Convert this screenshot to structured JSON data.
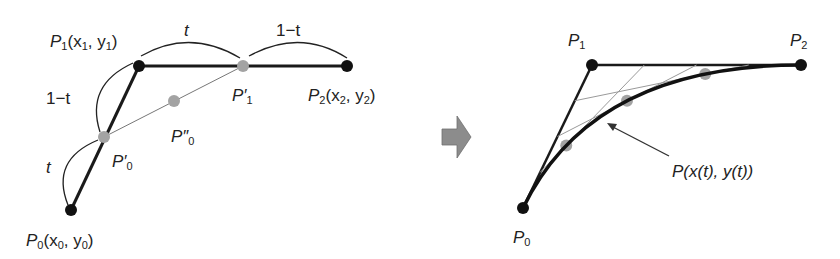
{
  "left_diagram": {
    "title": "de Casteljau construction",
    "points": {
      "P0": {
        "name": "P",
        "sub": "0",
        "coords": "(x",
        "coords_sub": "0",
        "coords_mid": ", y",
        "coords_sub2": "0",
        "coords_end": ")"
      },
      "P1": {
        "name": "P",
        "sub": "1",
        "coords": "(x",
        "coords_sub": "1",
        "coords_mid": ", y",
        "coords_sub2": "1",
        "coords_end": ")"
      },
      "P2": {
        "name": "P",
        "sub": "2",
        "coords": "(x",
        "coords_sub": "2",
        "coords_mid": ", y",
        "coords_sub2": "2",
        "coords_end": ")"
      },
      "P0prime": {
        "name": "P′",
        "sub": "0"
      },
      "P1prime": {
        "name": "P′",
        "sub": "1"
      },
      "P0dprime": {
        "name": "P″",
        "sub": "0"
      }
    },
    "ratio_labels": {
      "top_left": "t",
      "top_right": "1−t",
      "left_upper": "1−t",
      "left_lower": "t"
    },
    "colors": {
      "control_point": "#111111",
      "intermediate_point": "#a0a0a0",
      "line": "#1a1a1a",
      "thin_line": "#888888"
    }
  },
  "transition_arrow": {
    "icon": "right-arrow-icon",
    "color": "#8c8c8c"
  },
  "right_diagram": {
    "points": {
      "P0": {
        "name": "P",
        "sub": "0"
      },
      "P1": {
        "name": "P",
        "sub": "1"
      },
      "P2": {
        "name": "P",
        "sub": "2"
      }
    },
    "curve_label": "P(x(t), y(t))",
    "sample_t_values": [
      0.25,
      0.5,
      0.75
    ]
  }
}
